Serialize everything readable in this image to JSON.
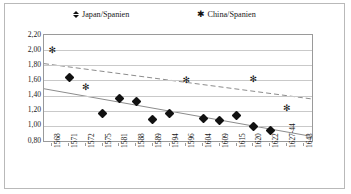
{
  "chart_data": {
    "type": "scatter",
    "title": "",
    "xlabel": "",
    "ylabel": "",
    "ylim": [
      0.8,
      2.2
    ],
    "ytick_labels": [
      "2,20",
      "2,00",
      "1,80",
      "1,60",
      "1,40",
      "1,20",
      "1,00",
      "0,80"
    ],
    "ytick_values": [
      2.2,
      2.0,
      1.8,
      1.6,
      1.4,
      1.2,
      1.0,
      0.8
    ],
    "grid": true,
    "legend_position": "top",
    "categories": [
      "1568",
      "1571",
      "1572",
      "1575",
      "1581",
      "1588",
      "1589",
      "1594",
      "1596",
      "1604",
      "1609",
      "1615",
      "1620",
      "1622",
      "1627-44",
      "1643"
    ],
    "series": [
      {
        "name": "Japan/Spanien",
        "marker": "diamond",
        "color": "#111111",
        "trendline": "solid",
        "trend_start": 1.49,
        "trend_end": 0.86,
        "points": [
          {
            "x": "1571",
            "y": 1.635
          },
          {
            "x": "1575",
            "y": 1.168
          },
          {
            "x": "1581",
            "y": 1.358
          },
          {
            "x": "1588",
            "y": 1.32
          },
          {
            "x": "1589",
            "y": 1.09
          },
          {
            "x": "1594",
            "y": 1.165
          },
          {
            "x": "1604",
            "y": 1.098
          },
          {
            "x": "1609",
            "y": 1.065
          },
          {
            "x": "1615",
            "y": 1.142
          },
          {
            "x": "1620",
            "y": 0.998
          },
          {
            "x": "1622",
            "y": 0.935
          }
        ]
      },
      {
        "name": "China/Spanien",
        "marker": "star",
        "color": "#111111",
        "trendline": "dashed",
        "trend_start": 1.822,
        "trend_end": 1.355,
        "points": [
          {
            "x": "1568",
            "y": 2.005
          },
          {
            "x": "1572",
            "y": 1.515
          },
          {
            "x": "1596",
            "y": 1.6
          },
          {
            "x": "1620",
            "y": 1.618
          },
          {
            "x": "1627-44",
            "y": 1.232
          }
        ]
      }
    ]
  },
  "legend": {
    "japan": {
      "label": "Japan/Spanien",
      "marker": "diamond-icon"
    },
    "china": {
      "label": "China/Spanien",
      "marker": "star-icon"
    }
  }
}
